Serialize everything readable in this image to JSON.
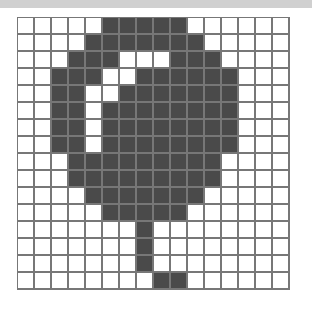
{
  "artwork": {
    "title": "Pixel Art Balloon Grid",
    "subject": "balloon",
    "grid_columns": 16,
    "grid_rows": 16,
    "cell_size_px": 17,
    "colors": {
      "filled": "#4a4a4a",
      "empty": "#ffffff",
      "gridline": "#777777",
      "top_band": "#d0d0d0",
      "page_background": "#ffffff"
    },
    "legend": [
      {
        "value": 1,
        "label": "filled",
        "color": "#4a4a4a"
      },
      {
        "value": 0,
        "label": "empty",
        "color": "#ffffff"
      }
    ],
    "rows": [
      [
        0,
        0,
        0,
        0,
        0,
        1,
        1,
        1,
        1,
        1,
        0,
        0,
        0,
        0,
        0,
        0
      ],
      [
        0,
        0,
        0,
        0,
        1,
        1,
        1,
        1,
        1,
        1,
        1,
        0,
        0,
        0,
        0,
        0
      ],
      [
        0,
        0,
        0,
        1,
        1,
        1,
        0,
        0,
        0,
        1,
        1,
        1,
        0,
        0,
        0,
        0
      ],
      [
        0,
        0,
        1,
        1,
        1,
        0,
        0,
        1,
        1,
        1,
        1,
        1,
        1,
        0,
        0,
        0
      ],
      [
        0,
        0,
        1,
        1,
        0,
        0,
        1,
        1,
        1,
        1,
        1,
        1,
        1,
        0,
        0,
        0
      ],
      [
        0,
        0,
        1,
        1,
        0,
        1,
        1,
        1,
        1,
        1,
        1,
        1,
        1,
        0,
        0,
        0
      ],
      [
        0,
        0,
        1,
        1,
        0,
        1,
        1,
        1,
        1,
        1,
        1,
        1,
        1,
        0,
        0,
        0
      ],
      [
        0,
        0,
        1,
        1,
        0,
        1,
        1,
        1,
        1,
        1,
        1,
        1,
        1,
        0,
        0,
        0
      ],
      [
        0,
        0,
        0,
        1,
        1,
        1,
        1,
        1,
        1,
        1,
        1,
        1,
        0,
        0,
        0,
        0
      ],
      [
        0,
        0,
        0,
        1,
        1,
        1,
        1,
        1,
        1,
        1,
        1,
        1,
        0,
        0,
        0,
        0
      ],
      [
        0,
        0,
        0,
        0,
        1,
        1,
        1,
        1,
        1,
        1,
        1,
        0,
        0,
        0,
        0,
        0
      ],
      [
        0,
        0,
        0,
        0,
        0,
        1,
        1,
        1,
        1,
        1,
        0,
        0,
        0,
        0,
        0,
        0
      ],
      [
        0,
        0,
        0,
        0,
        0,
        0,
        0,
        1,
        0,
        0,
        0,
        0,
        0,
        0,
        0,
        0
      ],
      [
        0,
        0,
        0,
        0,
        0,
        0,
        0,
        1,
        0,
        0,
        0,
        0,
        0,
        0,
        0,
        0
      ],
      [
        0,
        0,
        0,
        0,
        0,
        0,
        0,
        1,
        0,
        0,
        0,
        0,
        0,
        0,
        0,
        0
      ],
      [
        0,
        0,
        0,
        0,
        0,
        0,
        0,
        0,
        1,
        1,
        0,
        0,
        0,
        0,
        0,
        0
      ]
    ]
  }
}
